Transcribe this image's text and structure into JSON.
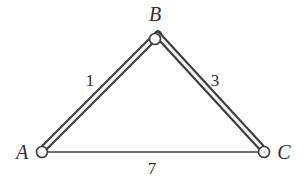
{
  "figure": {
    "type": "weighted-graph-diagram",
    "background_color": "#ffffff",
    "stroke_color": "#3f3f3f",
    "band_fill_color": "#f2f2f2",
    "node_fill_color": "#ffffff",
    "text_color": "#2e2e2e"
  },
  "nodes": [
    {
      "id": "A",
      "label": "A",
      "cx": 42,
      "cy": 152,
      "r": 5.5,
      "label_x": 22,
      "label_y": 159
    },
    {
      "id": "B",
      "label": "B",
      "cx": 155,
      "cy": 39,
      "r": 5.5,
      "label_x": 155,
      "label_y": 21
    },
    {
      "id": "C",
      "label": "C",
      "cx": 264,
      "cy": 152,
      "r": 5.5,
      "label_x": 284,
      "label_y": 159
    }
  ],
  "edges": [
    {
      "id": "AB",
      "from": "A",
      "to": "B",
      "weight": "1",
      "style": "thick-band",
      "label_x": 90,
      "label_y": 86
    },
    {
      "id": "BC",
      "from": "B",
      "to": "C",
      "weight": "3",
      "style": "thick-band",
      "label_x": 215,
      "label_y": 86
    },
    {
      "id": "AC",
      "from": "A",
      "to": "C",
      "weight": "7",
      "style": "thin-line",
      "label_x": 152,
      "label_y": 174
    }
  ]
}
